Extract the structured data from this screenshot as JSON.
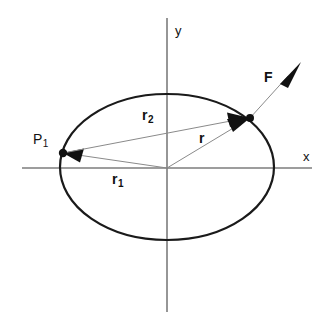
{
  "figure": {
    "background_color": "#ffffff",
    "width": 329,
    "height": 329
  },
  "axes": {
    "x_label": "x",
    "y_label": "y",
    "axis_color": "#7c7c7c",
    "origin": {
      "x": 167,
      "y": 168
    },
    "x_axis": {
      "x1": 22,
      "y1": 168,
      "x2": 312,
      "y2": 168
    },
    "y_axis": {
      "x1": 167,
      "y1": 18,
      "x2": 167,
      "y2": 312
    },
    "x_label_pos": {
      "x": 303,
      "y": 150
    },
    "y_label_pos": {
      "x": 175,
      "y": 24
    }
  },
  "ellipse": {
    "center": {
      "x": 167,
      "y": 167
    },
    "rx": 107,
    "ry": 73,
    "stroke_color": "#1a1a1a",
    "stroke_width": 2.2
  },
  "points": [
    {
      "name": "P1",
      "label": "P",
      "subscript": "1",
      "pos": {
        "x": 63,
        "y": 153
      },
      "label_pos": {
        "x": 33,
        "y": 132
      }
    },
    {
      "name": "surface-point",
      "label": "",
      "subscript": "",
      "pos": {
        "x": 250,
        "y": 118
      },
      "label_pos": {
        "x": 250,
        "y": 118
      }
    }
  ],
  "vectors": [
    {
      "name": "r1",
      "label": "r",
      "subscript": "1",
      "from": {
        "x": 167,
        "y": 168
      },
      "to": {
        "x": 63,
        "y": 153
      },
      "label_pos": {
        "x": 112,
        "y": 172
      },
      "description": "from origin to point P1"
    },
    {
      "name": "r2",
      "label": "r",
      "subscript": "2",
      "from": {
        "x": 63,
        "y": 153
      },
      "to": {
        "x": 250,
        "y": 118
      },
      "label_pos": {
        "x": 142,
        "y": 108
      },
      "description": "from point P1 to surface point"
    },
    {
      "name": "r",
      "label": "r",
      "subscript": "",
      "from": {
        "x": 167,
        "y": 168
      },
      "to": {
        "x": 250,
        "y": 118
      },
      "label_pos": {
        "x": 199,
        "y": 131
      },
      "description": "from origin to surface point"
    },
    {
      "name": "F",
      "label": "F",
      "subscript": "",
      "from": {
        "x": 250,
        "y": 118
      },
      "to": {
        "x": 301,
        "y": 62
      },
      "label_pos": {
        "x": 264,
        "y": 70
      },
      "description": "force vector at surface point"
    }
  ]
}
